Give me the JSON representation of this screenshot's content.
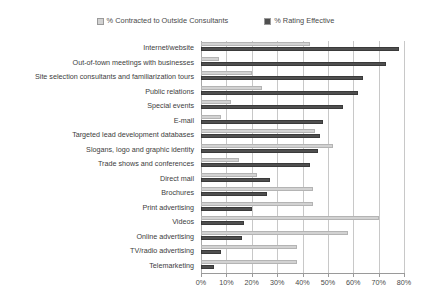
{
  "chart_data": {
    "type": "bar",
    "orientation": "horizontal",
    "title": "",
    "subtitle": "",
    "xlabel": "",
    "ylabel": "",
    "xlim": [
      0,
      80
    ],
    "xticks": [
      0,
      10,
      20,
      30,
      40,
      50,
      60,
      70,
      80
    ],
    "xtick_labels": [
      "0%",
      "10%",
      "20%",
      "30%",
      "40%",
      "50%",
      "60%",
      "70%",
      "80%"
    ],
    "grid": true,
    "legend_position": "top-center",
    "categories": [
      "Internet/website",
      "Out-of-town meetings with businesses",
      "Site selection consultants and familiarization tours",
      "Public relations",
      "Special events",
      "E-mail",
      "Targeted lead development databases",
      "Slogans, logo and graphic identity",
      "Trade shows and conferences",
      "Direct mail",
      "Brochures",
      "Print advertising",
      "Videos",
      "Online advertising",
      "TV/radio advertising",
      "Telemarketing"
    ],
    "series": [
      {
        "name": "% Contracted to Outside Consultants",
        "color": "#d2d2d2",
        "values": [
          43,
          7,
          20,
          24,
          12,
          8,
          45,
          52,
          15,
          22,
          44,
          44,
          70,
          58,
          38,
          38
        ]
      },
      {
        "name": "% Rating Effective",
        "color": "#4f4f4f",
        "values": [
          78,
          73,
          64,
          62,
          56,
          48,
          47,
          46,
          43,
          27,
          26,
          20,
          17,
          16,
          8,
          5
        ]
      }
    ]
  },
  "legend": {
    "entries": [
      {
        "label": "% Contracted to Outside Consultants",
        "color": "#d2d2d2"
      },
      {
        "label": "% Rating Effective",
        "color": "#4f4f4f"
      }
    ]
  },
  "colors": {
    "background": "#ffffff",
    "gridline": "#c8c8c8",
    "axis": "#9a9a9a",
    "text": "#3c3c3c",
    "series_light": "#d2d2d2",
    "series_dark": "#4f4f4f"
  }
}
